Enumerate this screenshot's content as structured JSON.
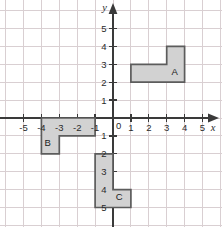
{
  "figure": {
    "name": "coordinate-plane-with-three-l-shapes",
    "background_color": "#ffffff",
    "grid_color": "#d9cfd2",
    "axis_color": "#3a3a3a",
    "shape_fill_color": "#d2d2d2",
    "shape_stroke_color": "#5c5c5c"
  },
  "axes": {
    "x_label": "x",
    "y_label": "y",
    "origin_label": "0",
    "x_tick_labels": [
      "-5",
      "-4",
      "-3",
      "-2",
      "-1",
      "1",
      "2",
      "3",
      "4",
      "5"
    ],
    "y_tick_labels_positive": [
      "1",
      "2",
      "3",
      "4",
      "5"
    ],
    "y_tick_labels_negative": [
      "1",
      "2",
      "3",
      "4",
      "5"
    ],
    "x_range": [
      -6,
      6
    ],
    "y_range": [
      -6,
      6
    ]
  },
  "shapes": [
    {
      "label": "A",
      "label_x": 3.45,
      "label_y": 2.42,
      "vertices": [
        [
          1,
          2
        ],
        [
          4,
          2
        ],
        [
          4,
          4
        ],
        [
          3,
          4
        ],
        [
          3,
          3
        ],
        [
          1,
          3
        ]
      ]
    },
    {
      "label": "B",
      "label_x": -3.65,
      "label_y": -1.58,
      "vertices": [
        [
          -4,
          0
        ],
        [
          -1,
          0
        ],
        [
          -1,
          -1
        ],
        [
          -3,
          -1
        ],
        [
          -3,
          -2
        ],
        [
          -4,
          -2
        ]
      ]
    },
    {
      "label": "C",
      "label_x": 0.35,
      "label_y": -4.58,
      "vertices": [
        [
          -1,
          -2
        ],
        [
          0,
          -2
        ],
        [
          0,
          -4
        ],
        [
          1,
          -4
        ],
        [
          1,
          -5
        ],
        [
          -1,
          -5
        ]
      ]
    }
  ]
}
